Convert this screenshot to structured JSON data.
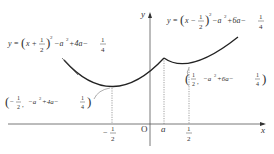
{
  "diagram": {
    "axes": {
      "x_label": "x",
      "y_label": "y",
      "origin_label": "O"
    },
    "left_curve": {
      "equation_parts": {
        "lhs": "y",
        "eq": "=",
        "x": "x",
        "plus": "+",
        "num": "1",
        "den": "2",
        "sq": "2",
        "tail1": "−a",
        "a2": "2",
        "tail2": "+4a−",
        "fnum": "1",
        "fden": "4"
      },
      "vertex_label": {
        "x_sign": "−",
        "x_num": "1",
        "x_den": "2",
        "comma": ",",
        "y_part": "−a",
        "a2": "2",
        "y_mid": "+4a−",
        "fnum": "1",
        "fden": "4"
      }
    },
    "right_curve": {
      "equation_parts": {
        "lhs": "y",
        "eq": "=",
        "x": "x",
        "minus": "−",
        "num": "1",
        "den": "2",
        "sq": "2",
        "tail1": "−a",
        "a2": "2",
        "tail2": "+6a−",
        "fnum": "1",
        "fden": "4"
      },
      "vertex_label": {
        "x_num": "1",
        "x_den": "2",
        "comma": ",",
        "y_part": "−a",
        "a2": "2",
        "y_mid": "+6a−",
        "fnum": "1",
        "fden": "4"
      }
    },
    "x_ticks": [
      {
        "sign": "−",
        "num": "1",
        "den": "2"
      },
      {
        "label": "a"
      },
      {
        "num": "1",
        "den": "2"
      }
    ]
  }
}
